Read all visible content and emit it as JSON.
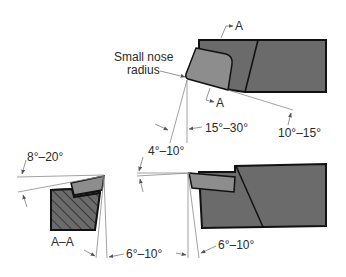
{
  "diagram": {
    "top_view": {
      "label_nose": [
        "Small nose",
        "radius"
      ],
      "section_marker": "A",
      "angles": {
        "end_cutting_edge": "15°–30°",
        "side_cutting_edge": "10°–15°"
      }
    },
    "section_view": {
      "label": "A–A",
      "angles": {
        "side_rake": "8°–20°",
        "side_relief": "6°–10°"
      }
    },
    "side_view": {
      "angles": {
        "back_rake": "4°–10°",
        "end_relief": "6°–10°"
      }
    },
    "colors": {
      "tool_body": "#6b6b6b",
      "insert": "#8d8d8d",
      "outline": "#111111",
      "dimension_lines": "#8a8a8a"
    }
  }
}
